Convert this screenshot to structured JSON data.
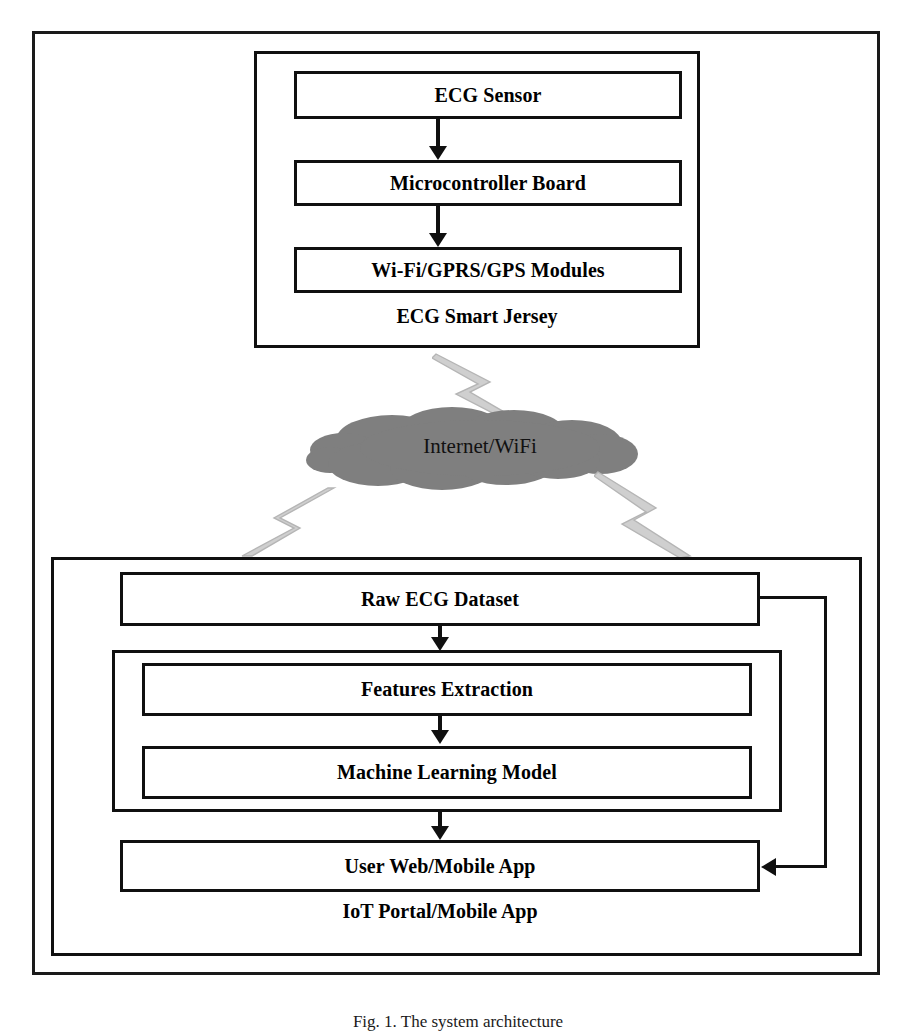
{
  "figure": {
    "caption": "Fig. 1.  The system architecture",
    "frame_color": "#1a1a1a"
  },
  "edge_device": {
    "group_caption": "ECG Smart Jersey",
    "blocks": [
      {
        "label": "ECG Sensor"
      },
      {
        "label": "Microcontroller Board"
      },
      {
        "label": "Wi-Fi/GPRS/GPS Modules"
      }
    ]
  },
  "network": {
    "cloud_label": "Internet/WiFi",
    "cloud_color": "#808080",
    "bolt_color": "#c9c9c9",
    "uplink_name": "uplink-lightning",
    "downlink_name": "downlink-lightning"
  },
  "cloud_platform": {
    "group_caption": "IoT Portal/Mobile App",
    "blocks": [
      {
        "label": "Raw ECG Dataset"
      },
      {
        "label": "Features Extraction"
      },
      {
        "label": "Machine Learning Model"
      },
      {
        "label": "User Web/Mobile App"
      }
    ]
  }
}
